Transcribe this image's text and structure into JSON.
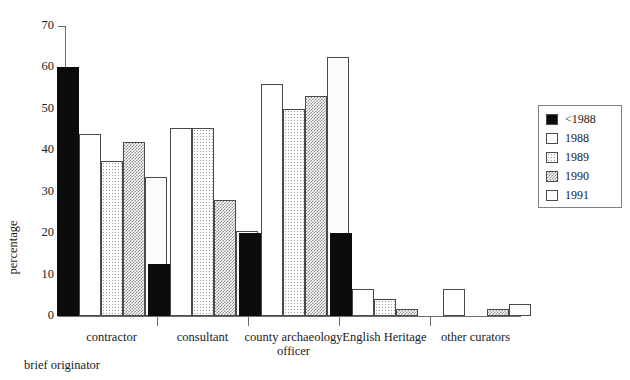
{
  "chart_data": {
    "type": "bar",
    "title": "",
    "xlabel": "brief originator",
    "ylabel": "percentage",
    "ylim": [
      0,
      70
    ],
    "yticks": [
      0,
      10,
      20,
      30,
      40,
      50,
      60,
      70
    ],
    "grid": false,
    "legend_position": "right",
    "categories": [
      "contractor",
      "consultant",
      "county archaeology officer",
      "English Heritage",
      "other curators"
    ],
    "category_lines": [
      [
        "contractor"
      ],
      [
        "consultant"
      ],
      [
        "county archaeology",
        "officer"
      ],
      [
        "English Heritage"
      ],
      [
        "other curators"
      ]
    ],
    "series": [
      {
        "name": "<1988",
        "fill": "solid",
        "values": [
          60,
          12.5,
          20,
          20,
          0
        ]
      },
      {
        "name": "1988",
        "fill": "empty",
        "values": [
          44,
          45.5,
          56,
          6.5,
          6.5
        ]
      },
      {
        "name": "1989",
        "fill": "dots",
        "values": [
          37.5,
          45.5,
          50,
          4,
          0
        ]
      },
      {
        "name": "1990",
        "fill": "checker",
        "values": [
          42,
          28,
          53,
          1.7,
          1.7
        ]
      },
      {
        "name": "1991",
        "fill": "faint",
        "values": [
          33.5,
          20.5,
          62.5,
          0,
          3
        ]
      }
    ]
  },
  "colors": {
    "solid": "#0c0c0c",
    "empty": "#ffffff",
    "outline": "#4a4a4a",
    "axis": "#6d6d6d",
    "text": "#1a1a1a",
    "legend_border": "#808080"
  }
}
